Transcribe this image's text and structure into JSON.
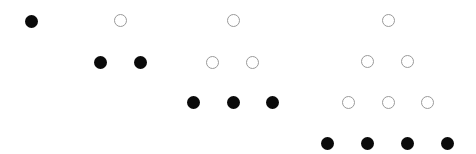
{
  "diagram": {
    "title": "",
    "colors": {
      "background": "#ffffff",
      "filled": "#0a0a0a",
      "open_stroke": "#9a9a9a"
    },
    "dot_diameter": 13,
    "figures": [
      {
        "index": 1,
        "count": 1,
        "dots": [
          {
            "x": 31,
            "y": 21,
            "type": "filled"
          }
        ]
      },
      {
        "index": 2,
        "count": 3,
        "dots": [
          {
            "x": 120,
            "y": 20,
            "type": "open"
          },
          {
            "x": 100,
            "y": 62,
            "type": "filled"
          },
          {
            "x": 140,
            "y": 62,
            "type": "filled"
          }
        ]
      },
      {
        "index": 3,
        "count": 6,
        "dots": [
          {
            "x": 233,
            "y": 20,
            "type": "open"
          },
          {
            "x": 212,
            "y": 62,
            "type": "open"
          },
          {
            "x": 252,
            "y": 62,
            "type": "open"
          },
          {
            "x": 193,
            "y": 102,
            "type": "filled"
          },
          {
            "x": 233,
            "y": 102,
            "type": "filled"
          },
          {
            "x": 272,
            "y": 102,
            "type": "filled"
          }
        ]
      },
      {
        "index": 4,
        "count": 10,
        "dots": [
          {
            "x": 388,
            "y": 20,
            "type": "open"
          },
          {
            "x": 367,
            "y": 61,
            "type": "open"
          },
          {
            "x": 407,
            "y": 61,
            "type": "open"
          },
          {
            "x": 348,
            "y": 102,
            "type": "open"
          },
          {
            "x": 388,
            "y": 102,
            "type": "open"
          },
          {
            "x": 427,
            "y": 102,
            "type": "open"
          },
          {
            "x": 327,
            "y": 143,
            "type": "filled"
          },
          {
            "x": 367,
            "y": 143,
            "type": "filled"
          },
          {
            "x": 407,
            "y": 143,
            "type": "filled"
          },
          {
            "x": 447,
            "y": 143,
            "type": "filled"
          }
        ]
      }
    ]
  }
}
